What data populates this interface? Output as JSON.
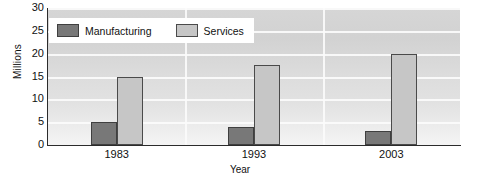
{
  "chart_data": {
    "type": "bar",
    "title": "",
    "subtitle": "",
    "xlabel": "Year",
    "ylabel": "Millions",
    "categories": [
      "1983",
      "1993",
      "2003"
    ],
    "series": [
      {
        "name": "Manufacturing",
        "color": "#787878",
        "values": [
          5,
          4,
          3
        ]
      },
      {
        "name": "Services",
        "color": "#c6c6c6",
        "values": [
          15,
          17.5,
          20
        ]
      }
    ],
    "ylim": [
      0,
      30
    ],
    "ytick_step": 5,
    "yticks": [
      30,
      25,
      20,
      15,
      10,
      5,
      0
    ],
    "grid": {
      "horizontal": true,
      "vertical": true,
      "color": "#fbfbfb"
    },
    "legend": {
      "position": "top-left",
      "background": "#ffffff"
    },
    "plot_background": "#dcdcdc",
    "axis_color": "#2b2b2b"
  },
  "axes": {
    "y_title": "Millions",
    "x_title": "Year"
  },
  "legend": {
    "entries": [
      {
        "label": "Manufacturing",
        "swatch": "manufacturing-swatch"
      },
      {
        "label": "Services",
        "swatch": "services-swatch"
      }
    ]
  }
}
